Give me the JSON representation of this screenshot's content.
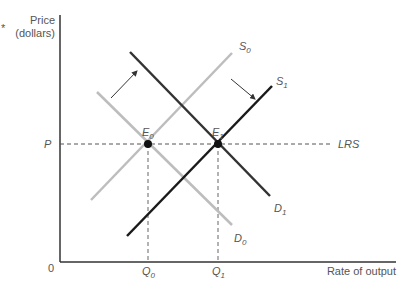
{
  "diagram": {
    "type": "supply-demand",
    "axes": {
      "y_label_line1": "Price",
      "y_label_line2": "(dollars)",
      "x_label": "Rate of output",
      "origin": "0"
    },
    "price_level": {
      "label": "P"
    },
    "quantities": [
      {
        "base": "Q",
        "sub": "0"
      },
      {
        "base": "Q",
        "sub": "1"
      }
    ],
    "curves": {
      "S0": {
        "base": "S",
        "sub": "0",
        "color": "#bdbdbd"
      },
      "S1": {
        "base": "S",
        "sub": "1",
        "color": "#1a1a1a"
      },
      "D0": {
        "base": "D",
        "sub": "0",
        "color": "#bdbdbd"
      },
      "D1": {
        "base": "D",
        "sub": "1",
        "color": "#333333"
      },
      "LRS": {
        "label": "LRS",
        "style": "dashed"
      }
    },
    "equilibria": [
      {
        "base": "E",
        "sub": "0"
      },
      {
        "base": "E",
        "sub": "1"
      }
    ],
    "marker": "*"
  }
}
